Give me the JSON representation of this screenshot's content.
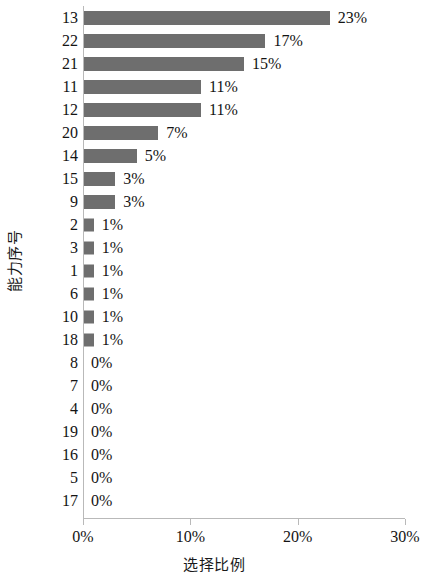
{
  "chart_data": {
    "type": "bar",
    "orientation": "horizontal",
    "title": "",
    "xlabel": "选择比例",
    "ylabel": "能力序号",
    "categories": [
      "13",
      "22",
      "21",
      "11",
      "12",
      "20",
      "14",
      "15",
      "9",
      "2",
      "3",
      "1",
      "6",
      "10",
      "18",
      "8",
      "7",
      "4",
      "19",
      "16",
      "5",
      "17"
    ],
    "values": [
      23,
      17,
      15,
      11,
      11,
      7,
      5,
      3,
      3,
      1,
      1,
      1,
      1,
      1,
      1,
      0,
      0,
      0,
      0,
      0,
      0,
      0
    ],
    "data_labels": [
      "23%",
      "17%",
      "15%",
      "11%",
      "11%",
      "7%",
      "5%",
      "3%",
      "3%",
      "1%",
      "1%",
      "1%",
      "1%",
      "1%",
      "1%",
      "0%",
      "0%",
      "0%",
      "0%",
      "0%",
      "0%",
      "0%"
    ],
    "xlim": [
      0,
      30
    ],
    "x_ticks": [
      0,
      10,
      20,
      30
    ],
    "x_tick_labels": [
      "0%",
      "10%",
      "20%",
      "30%"
    ],
    "grid": false,
    "legend": false,
    "bar_color": "#6e6e6e",
    "axis_color": "#b9b9b9",
    "text_color": "#141414"
  }
}
